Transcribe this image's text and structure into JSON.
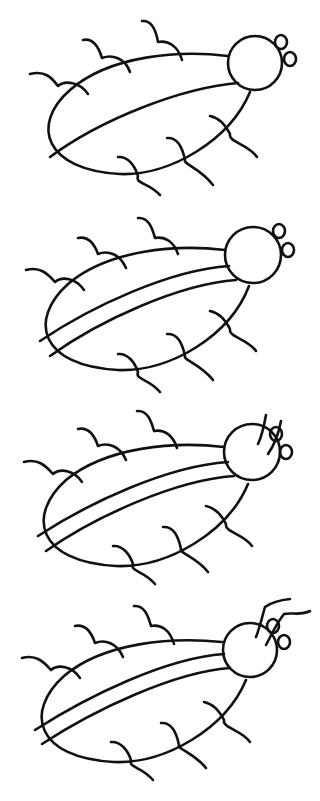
{
  "ink_color": "#111111",
  "background": "#ffffff",
  "stages": [
    {
      "step": 1,
      "label": "Step 1",
      "offset_y": 0,
      "wing_lines": 1,
      "antennae": "none"
    },
    {
      "step": 2,
      "label": "Step 2",
      "offset_y": 198,
      "wing_lines": 2,
      "antennae": "none"
    },
    {
      "step": 3,
      "label": "Step 3",
      "offset_y": 396,
      "wing_lines": 2,
      "antennae": "short"
    },
    {
      "step": 4,
      "label": "Step 4",
      "offset_y": 592,
      "wing_lines": 2,
      "antennae": "long"
    }
  ]
}
